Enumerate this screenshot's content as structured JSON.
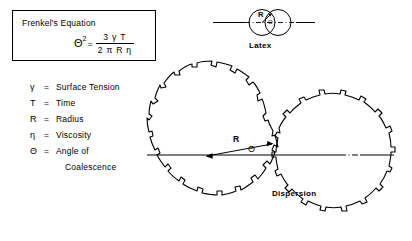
{
  "figure": {
    "background_color": "#ffffff",
    "ink_color": "#000000"
  },
  "equation_box": {
    "title": "Frenkel's Equation",
    "lhs": "Θ",
    "lhs_exponent": "2",
    "equals": "=",
    "numerator": "3 γ T",
    "denominator": "2 π R η",
    "plain_text": "Θ² = 3γT / 2πRη"
  },
  "legend": {
    "items": [
      {
        "symbol": "γ",
        "equals": "=",
        "definition": "Surface Tension",
        "definition_line2": ""
      },
      {
        "symbol": "T",
        "equals": "=",
        "definition": "Time",
        "definition_line2": ""
      },
      {
        "symbol": "R",
        "equals": "=",
        "definition": "Radius",
        "definition_line2": ""
      },
      {
        "symbol": "η",
        "equals": "=",
        "definition": "Viscosity",
        "definition_line2": ""
      },
      {
        "symbol": "Θ",
        "equals": "=",
        "definition": "Angle of",
        "definition_line2": "Coalescence"
      }
    ]
  },
  "latex_diagram": {
    "label": "Latex",
    "radius_label": "R",
    "angle_label": "Θ"
  },
  "dispersion_diagram": {
    "label": "Dispersion",
    "radius_label": "R",
    "angle_label": "Θ"
  }
}
